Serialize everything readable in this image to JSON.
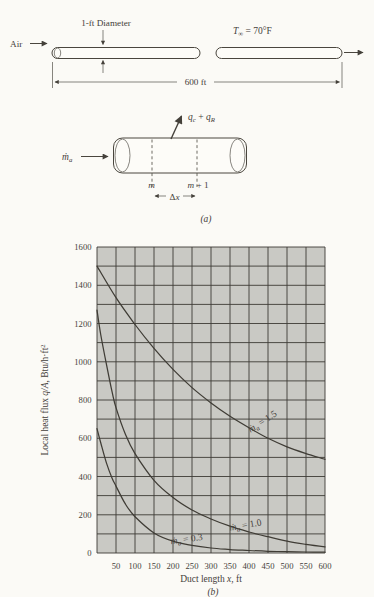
{
  "figure": {
    "panel_a_label": "(a)",
    "panel_b_label": "(b)"
  },
  "diagram_a": {
    "air_label": "Air",
    "diameter_label": "1-ft Diameter",
    "length_label": "600 ft",
    "ambient_temp": {
      "var": "T",
      "sub": "∞",
      "rest": " = 70°F"
    }
  },
  "element": {
    "mass_flow": {
      "var": "ṁ",
      "sub": "a"
    },
    "heat_arrow": {
      "q1": "q",
      "q1sub": "c",
      "plus": " + ",
      "q2": "q",
      "q2sub": "R"
    },
    "node_m": "m",
    "node_m1_var": "m",
    "node_m1_rest": " + 1",
    "delta": "Δ",
    "delta_var": "x"
  },
  "chart_data": {
    "type": "line",
    "title": "",
    "xlabel": {
      "pre": "Duct length ",
      "var": "x",
      "post": ", ft"
    },
    "ylabel": {
      "pre": "Local heat flux ",
      "var": "q/A",
      "mid": ", Btu/h·ft",
      "sup": "2"
    },
    "xlim": [
      0,
      600
    ],
    "ylim": [
      0,
      1600
    ],
    "x_grid_step": 50,
    "y_grid_step": 100,
    "grid": true,
    "legend_position": "on-curve",
    "plot_bg": "#c9c9c4",
    "grid_color": "#3d3b35",
    "line_color": "#3f3c35",
    "x_ticks": {
      "values": [
        50,
        100,
        150,
        200,
        250,
        300,
        350,
        400,
        450,
        500,
        550,
        600
      ],
      "labels": [
        "50",
        "100",
        "150",
        "200",
        "250",
        "300",
        "350",
        "400",
        "450",
        "500",
        "550",
        "600"
      ]
    },
    "y_ticks": {
      "values": [
        0,
        200,
        400,
        600,
        800,
        1000,
        1200,
        1400,
        1600
      ],
      "labels": [
        "0",
        "200",
        "400",
        "600",
        "800",
        "1000",
        "1200",
        "1400",
        "1600"
      ]
    },
    "series": [
      {
        "id": "1.5",
        "label": {
          "var": "ṁ",
          "sub": "a",
          "rest": " = 1.5"
        },
        "x": [
          0,
          50,
          100,
          150,
          200,
          250,
          300,
          350,
          400,
          450,
          500,
          550,
          600
        ],
        "y": [
          1500,
          1335,
          1195,
          1070,
          960,
          865,
          785,
          715,
          655,
          600,
          555,
          520,
          490
        ]
      },
      {
        "id": "1.0",
        "label": {
          "var": "ṁ",
          "sub": "a",
          "rest": " = 1.0"
        },
        "x": [
          0,
          10,
          25,
          40,
          50,
          75,
          100,
          150,
          200,
          250,
          300,
          350,
          400,
          450,
          500,
          550,
          600
        ],
        "y": [
          1270,
          1140,
          985,
          840,
          760,
          620,
          520,
          380,
          290,
          225,
          178,
          140,
          110,
          85,
          62,
          45,
          32
        ]
      },
      {
        "id": "0.3",
        "label": {
          "var": "ṁ",
          "sub": "a",
          "rest": " = 0.3"
        },
        "x": [
          0,
          10,
          25,
          40,
          50,
          75,
          100,
          150,
          200,
          250,
          300,
          350,
          400,
          450,
          500,
          550,
          600
        ],
        "y": [
          650,
          575,
          470,
          390,
          350,
          255,
          190,
          105,
          62,
          40,
          26,
          18,
          13,
          9,
          7,
          5,
          4
        ]
      }
    ]
  }
}
